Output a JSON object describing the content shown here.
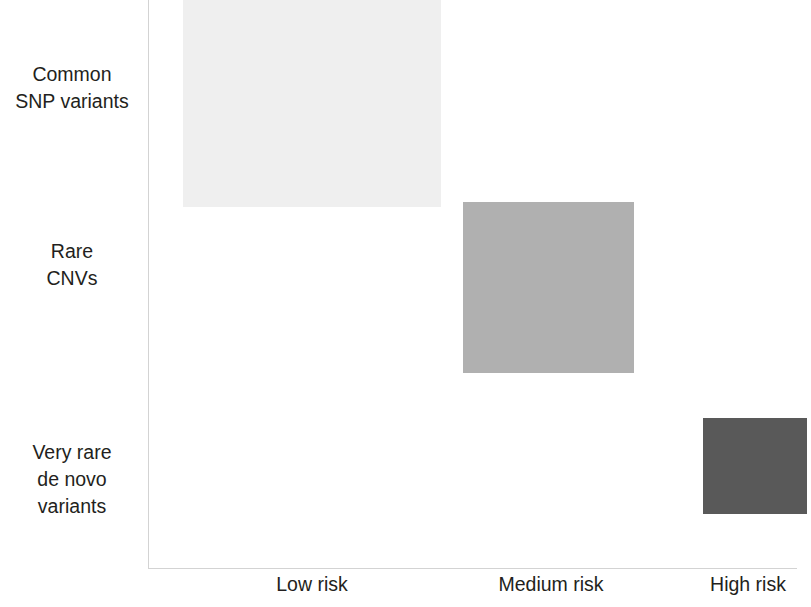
{
  "figure": {
    "background_color": "#ffffff",
    "axis_color": "#d3d3d3",
    "text_color": "#231f20"
  },
  "chart_data": {
    "type": "scatter",
    "title": "",
    "subtitle": "",
    "xlabel": "",
    "ylabel": "",
    "grid": false,
    "legend": "none",
    "x_categories": [
      "Low risk",
      "Medium risk",
      "High risk"
    ],
    "y_categories": [
      "Common SNP variants",
      "Rare CNVs",
      "Very rare de novo variants"
    ],
    "xlim": [
      0,
      3
    ],
    "ylim": [
      0,
      3
    ],
    "series": [
      {
        "name": "Common SNP variants",
        "x_category": "Low risk",
        "y_category": "Common SNP variants",
        "color": "#efefef",
        "box": {
          "x": 183,
          "y": -4,
          "width": 258,
          "height": 211
        }
      },
      {
        "name": "Rare CNVs",
        "x_category": "Medium risk",
        "y_category": "Rare CNVs",
        "color": "#b0b0b0",
        "box": {
          "x": 463,
          "y": 202,
          "width": 171,
          "height": 171
        }
      },
      {
        "name": "Very rare de novo variants",
        "x_category": "High risk",
        "y_category": "Very rare de novo variants",
        "color": "#595959",
        "box": {
          "x": 703,
          "y": 418,
          "width": 104,
          "height": 96
        }
      }
    ]
  },
  "y_axis": {
    "labels": [
      {
        "id": "common",
        "text": "Common\nSNP variants"
      },
      {
        "id": "rare",
        "text": "Rare\nCNVs"
      },
      {
        "id": "veryrare",
        "text": "Very rare\nde novo\nvariants"
      }
    ]
  },
  "x_axis": {
    "labels": [
      {
        "id": "low",
        "text": "Low risk"
      },
      {
        "id": "medium",
        "text": "Medium risk"
      },
      {
        "id": "high",
        "text": "High risk"
      }
    ]
  }
}
